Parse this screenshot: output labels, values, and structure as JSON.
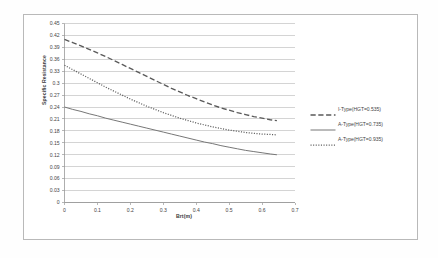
{
  "chart_data": {
    "type": "line",
    "title": "",
    "xlabel": "Brt(m)",
    "ylabel": "Specific Resistance",
    "xlim": [
      0,
      0.7
    ],
    "ylim": [
      0,
      0.45
    ],
    "grid": true,
    "legend_position": "right",
    "x_ticks": [
      "0",
      "0.1",
      "0.2",
      "0.3",
      "0.4",
      "0.5",
      "0.6",
      "0.7"
    ],
    "x_tick_values": [
      0,
      0.1,
      0.2,
      0.3,
      0.4,
      0.5,
      0.6,
      0.7
    ],
    "y_ticks": [
      "0",
      "0.03",
      "0.06",
      "0.09",
      "0.12",
      "0.15",
      "0.18",
      "0.21",
      "0.24",
      "0.27",
      "0.3",
      "0.33",
      "0.36",
      "0.39",
      "0.42",
      "0.45"
    ],
    "y_tick_values": [
      0,
      0.03,
      0.06,
      0.09,
      0.12,
      0.15,
      0.18,
      0.21,
      0.24,
      0.27,
      0.3,
      0.33,
      0.36,
      0.39,
      0.42,
      0.45
    ],
    "series": [
      {
        "name": "I-Type(HGT=0.535)",
        "style": "dashed",
        "color": "#5a5a5a",
        "x": [
          0.0,
          0.025,
          0.05,
          0.075,
          0.1,
          0.125,
          0.15,
          0.175,
          0.2,
          0.225,
          0.25,
          0.275,
          0.3,
          0.325,
          0.35,
          0.375,
          0.4,
          0.425,
          0.45,
          0.475,
          0.5,
          0.525,
          0.55,
          0.575,
          0.6,
          0.625,
          0.645
        ],
        "values": [
          0.41,
          0.402,
          0.394,
          0.385,
          0.376,
          0.367,
          0.357,
          0.347,
          0.337,
          0.327,
          0.317,
          0.307,
          0.297,
          0.287,
          0.278,
          0.269,
          0.261,
          0.253,
          0.245,
          0.238,
          0.232,
          0.226,
          0.221,
          0.216,
          0.212,
          0.208,
          0.206
        ]
      },
      {
        "name": "A-Type(HGT=0.735)",
        "style": "solid",
        "color": "#777777",
        "x": [
          0.0,
          0.025,
          0.05,
          0.075,
          0.1,
          0.125,
          0.15,
          0.175,
          0.2,
          0.225,
          0.25,
          0.275,
          0.3,
          0.325,
          0.35,
          0.375,
          0.4,
          0.425,
          0.45,
          0.475,
          0.5,
          0.525,
          0.55,
          0.575,
          0.6,
          0.625,
          0.645
        ],
        "values": [
          0.24,
          0.234,
          0.229,
          0.223,
          0.218,
          0.212,
          0.207,
          0.202,
          0.197,
          0.192,
          0.187,
          0.182,
          0.177,
          0.172,
          0.167,
          0.162,
          0.157,
          0.152,
          0.148,
          0.143,
          0.139,
          0.135,
          0.131,
          0.128,
          0.125,
          0.122,
          0.12
        ]
      },
      {
        "name": "A-Type(HGT=0.935)",
        "style": "dotted",
        "color": "#5f5f5f",
        "x": [
          0.0,
          0.025,
          0.05,
          0.075,
          0.1,
          0.125,
          0.15,
          0.175,
          0.2,
          0.225,
          0.25,
          0.275,
          0.3,
          0.325,
          0.35,
          0.375,
          0.4,
          0.425,
          0.45,
          0.475,
          0.5,
          0.525,
          0.55,
          0.575,
          0.6,
          0.625,
          0.645
        ],
        "values": [
          0.345,
          0.334,
          0.323,
          0.312,
          0.301,
          0.29,
          0.28,
          0.27,
          0.26,
          0.251,
          0.242,
          0.234,
          0.226,
          0.219,
          0.212,
          0.206,
          0.2,
          0.195,
          0.19,
          0.186,
          0.182,
          0.179,
          0.176,
          0.174,
          0.172,
          0.171,
          0.17
        ]
      }
    ]
  },
  "legend": {
    "items": [
      {
        "label": "I-Type(HGT=0.535)",
        "style": "dashed"
      },
      {
        "label": "A-Type(HGT=0.735)",
        "style": "solid"
      },
      {
        "label": "A-Type(HGT=0.935)",
        "style": "dotted"
      }
    ]
  },
  "axes": {
    "y_title": "Specific Resistance",
    "x_title": "Brt(m)"
  }
}
